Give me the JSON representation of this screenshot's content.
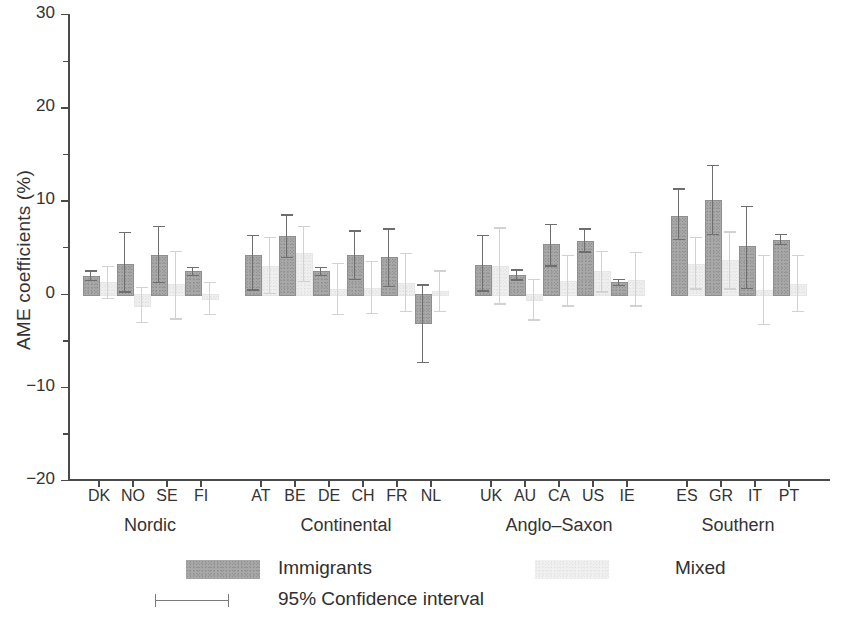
{
  "chart_data": {
    "type": "bar",
    "title": "",
    "xlabel": "",
    "ylabel": "AME coefficients (%)",
    "ylim": [
      -20,
      30
    ],
    "yticks": [
      30,
      20,
      10,
      0,
      -10,
      -20
    ],
    "ytick_labels": [
      "30",
      "20",
      "10",
      "0",
      "−10",
      "−20"
    ],
    "grid": false,
    "legend_position": "bottom",
    "groups": [
      {
        "name": "Nordic",
        "countries": [
          "DK",
          "NO",
          "SE",
          "FI"
        ]
      },
      {
        "name": "Continental",
        "countries": [
          "AT",
          "BE",
          "DE",
          "CH",
          "FR",
          "NL"
        ]
      },
      {
        "name": "Anglo–Saxon",
        "countries": [
          "UK",
          "AU",
          "CA",
          "US",
          "IE"
        ]
      },
      {
        "name": "Southern",
        "countries": [
          "ES",
          "GR",
          "IT",
          "PT"
        ]
      }
    ],
    "categories": [
      "DK",
      "NO",
      "SE",
      "FI",
      "AT",
      "BE",
      "DE",
      "CH",
      "FR",
      "NL",
      "UK",
      "AU",
      "CA",
      "US",
      "IE",
      "ES",
      "GR",
      "IT",
      "PT"
    ],
    "series": [
      {
        "name": "Immigrants",
        "color": "#a8a8a8",
        "values": [
          1.9,
          3.2,
          4.2,
          2.4,
          4.2,
          6.2,
          2.4,
          4.1,
          3.9,
          -3.0,
          3.1,
          2.0,
          5.3,
          5.7,
          1.2,
          8.3,
          10.1,
          5.1,
          5.8
        ],
        "ci_low": [
          1.3,
          0.1,
          1.1,
          1.9,
          0.3,
          3.8,
          1.9,
          1.4,
          0.7,
          -7.5,
          0.2,
          1.4,
          2.9,
          4.4,
          0.8,
          5.7,
          6.3,
          0.5,
          5.2
        ],
        "ci_high": [
          2.5,
          6.6,
          7.3,
          2.9,
          6.3,
          8.5,
          2.9,
          6.8,
          7.0,
          1.0,
          6.3,
          2.6,
          7.5,
          7.0,
          1.6,
          11.3,
          13.8,
          9.4,
          6.4
        ]
      },
      {
        "name": "Mixed",
        "color": "#efefef",
        "values": [
          1.2,
          -1.2,
          1.0,
          -0.5,
          3.0,
          4.4,
          0.5,
          0.6,
          1.1,
          0.3,
          3.0,
          -0.6,
          1.4,
          2.4,
          1.5,
          3.2,
          3.6,
          0.4,
          1.0
        ],
        "ci_low": [
          -0.6,
          -3.2,
          -2.8,
          -2.3,
          -0.1,
          1.2,
          -2.3,
          -2.2,
          -2.0,
          -2.0,
          -1.2,
          -2.9,
          -1.4,
          0.1,
          -1.4,
          0.4,
          0.4,
          -3.4,
          -2.0
        ],
        "ci_high": [
          3.0,
          0.7,
          4.6,
          1.3,
          6.1,
          7.3,
          3.3,
          3.5,
          4.4,
          2.5,
          7.1,
          1.6,
          4.2,
          4.6,
          4.5,
          6.1,
          6.7,
          4.2,
          4.2
        ]
      }
    ],
    "legend": [
      {
        "label": "Immigrants",
        "swatch": "dark-gray"
      },
      {
        "label": "Mixed",
        "swatch": "light-gray"
      },
      {
        "label": "95% Confidence interval",
        "swatch": "error-bar"
      }
    ]
  }
}
